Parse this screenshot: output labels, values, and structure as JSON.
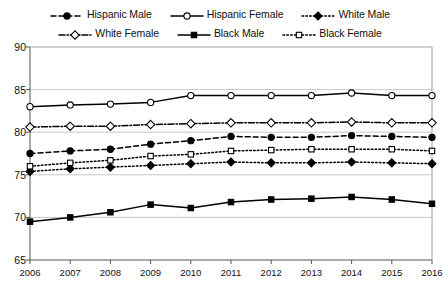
{
  "legend": {
    "rows": [
      [
        {
          "label": "Hispanic Male",
          "key": "hispanic_male",
          "icon": "dashed-filled-circle-marker"
        },
        {
          "label": "Hispanic Female",
          "key": "hispanic_female",
          "icon": "solid-open-circle-marker"
        },
        {
          "label": "White Male",
          "key": "white_male",
          "icon": "dotted-filled-diamond-marker"
        }
      ],
      [
        {
          "label": "White Female",
          "key": "white_female",
          "icon": "dashdot-open-diamond-marker"
        },
        {
          "label": "Black Male",
          "key": "black_male",
          "icon": "solid-filled-square-marker"
        },
        {
          "label": "Black Female",
          "key": "black_female",
          "icon": "dotted-open-square-marker"
        }
      ]
    ]
  },
  "chart_data": {
    "type": "line",
    "title": "",
    "subtitle": "",
    "xlabel": "",
    "ylabel": "",
    "categories": [
      "2006",
      "2007",
      "2008",
      "2009",
      "2010",
      "2011",
      "2012",
      "2013",
      "2014",
      "2015",
      "2016"
    ],
    "x": [
      2006,
      2007,
      2008,
      2009,
      2010,
      2011,
      2012,
      2013,
      2014,
      2015,
      2016
    ],
    "ylim": [
      65,
      90
    ],
    "yticks": [
      65,
      70,
      75,
      80,
      85,
      90
    ],
    "grid": "horizontal",
    "legend_position": "top",
    "series": [
      {
        "name": "Hispanic Male",
        "key": "hispanic_male",
        "color": "#000000",
        "marker": "filled-circle",
        "dash": "5,3",
        "values": [
          77.5,
          77.8,
          78.0,
          78.6,
          79.0,
          79.5,
          79.4,
          79.4,
          79.6,
          79.5,
          79.4
        ]
      },
      {
        "name": "Hispanic Female",
        "key": "hispanic_female",
        "color": "#000000",
        "marker": "open-circle",
        "dash": "none",
        "values": [
          83.0,
          83.2,
          83.3,
          83.5,
          84.3,
          84.3,
          84.3,
          84.3,
          84.6,
          84.3,
          84.3
        ]
      },
      {
        "name": "White Male",
        "key": "white_male",
        "color": "#000000",
        "marker": "filled-diamond",
        "dash": "1.6,2.2",
        "values": [
          75.4,
          75.7,
          75.9,
          76.1,
          76.3,
          76.5,
          76.4,
          76.4,
          76.5,
          76.4,
          76.3
        ]
      },
      {
        "name": "White Female",
        "key": "white_female",
        "color": "#000000",
        "marker": "open-diamond",
        "dash": "6,2,1.5,2",
        "values": [
          80.6,
          80.7,
          80.7,
          80.9,
          81.0,
          81.1,
          81.1,
          81.1,
          81.2,
          81.1,
          81.1
        ]
      },
      {
        "name": "Black Male",
        "key": "black_male",
        "color": "#000000",
        "marker": "filled-square",
        "dash": "none",
        "values": [
          69.5,
          70.0,
          70.6,
          71.5,
          71.1,
          71.8,
          72.1,
          72.2,
          72.4,
          72.1,
          71.6
        ]
      },
      {
        "name": "Black Female",
        "key": "black_female",
        "color": "#000000",
        "marker": "open-square",
        "dash": "1.6,2.2",
        "values": [
          76.0,
          76.4,
          76.7,
          77.2,
          77.4,
          77.8,
          77.9,
          78.0,
          78.0,
          78.0,
          77.8
        ]
      }
    ]
  }
}
